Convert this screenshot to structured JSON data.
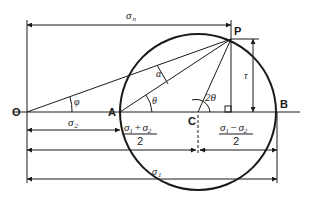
{
  "diagram": {
    "points": {
      "O": "O",
      "A": "A",
      "B": "B",
      "C": "C",
      "P": "P"
    },
    "angles": {
      "phi": "φ",
      "alpha": "α",
      "theta": "θ",
      "two_theta": "2θ"
    },
    "dimensions": {
      "sigma_n": "σ",
      "sigma_n_sub": "n",
      "sigma_2": "σ",
      "sigma_2_sub": "2",
      "sigma_1": "σ",
      "sigma_1_sub": "1",
      "tau": "τ",
      "mean_num_a": "σ",
      "mean_num_a_sub": "1",
      "mean_op": "+",
      "mean_num_b": "σ",
      "mean_num_b_sub": "2",
      "mean_den": "2",
      "radius_num_a": "σ",
      "radius_num_a_sub": "1",
      "radius_op": "−",
      "radius_num_b": "σ",
      "radius_num_b_sub": "2",
      "radius_den": "2"
    }
  }
}
